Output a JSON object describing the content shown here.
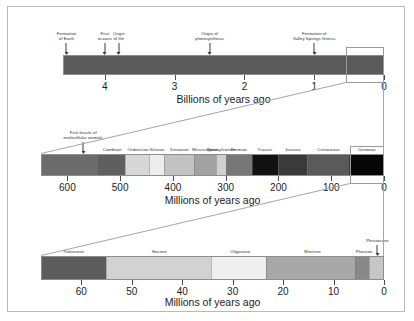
{
  "figure": {
    "background": "#ffffff",
    "border_color": "#b9b9b9"
  },
  "bands": [
    {
      "id": "precambrian-to-present",
      "axis_caption": "Billions of years ago",
      "axis_unit": "billions",
      "axis_min": 0,
      "axis_max": 4.6,
      "ticks": [
        {
          "value": 4,
          "label": "4"
        },
        {
          "value": 3,
          "label": "3"
        },
        {
          "value": 2,
          "label": "2"
        },
        {
          "value": 1,
          "label": "1"
        },
        {
          "value": 0,
          "label": "0"
        }
      ],
      "bar_color": "#5b5b5b",
      "events": [
        {
          "label_line1": "Formation",
          "label_line2": "of Earth",
          "value": 4.55
        },
        {
          "label_line1": "First",
          "label_line2": "oceans",
          "value": 4.0
        },
        {
          "label_line1": "Origin",
          "label_line2": "of life",
          "value": 3.8
        },
        {
          "label_line1": "Origin of",
          "label_line2": "photosynthesis",
          "value": 2.5
        },
        {
          "label_line1": "Formation of",
          "label_line2": "Valley Springs  Gneiss",
          "value": 1.0
        }
      ],
      "zoom_box": {
        "from_value": 0.55,
        "to_value": 0.0
      }
    },
    {
      "id": "phanerozoic",
      "axis_caption": "Millions of years ago",
      "axis_unit": "millions",
      "axis_min": 0,
      "axis_max": 650,
      "ticks": [
        {
          "value": 600,
          "label": "600"
        },
        {
          "value": 500,
          "label": "500"
        },
        {
          "value": 400,
          "label": "400"
        },
        {
          "value": 300,
          "label": "300"
        },
        {
          "value": 200,
          "label": "200"
        },
        {
          "value": 100,
          "label": "100"
        },
        {
          "value": 0,
          "label": "0"
        }
      ],
      "periods": [
        {
          "name": "",
          "from": 650,
          "to": 542,
          "color": "#6c6c6c",
          "show_label": false
        },
        {
          "name": "Cambrian",
          "from": 542,
          "to": 488,
          "color": "#5f5f5f",
          "show_label": true
        },
        {
          "name": "Ordovician",
          "from": 488,
          "to": 444,
          "color": "#d7d7d7",
          "show_label": true
        },
        {
          "name": "Silurian",
          "from": 444,
          "to": 416,
          "color": "#ededed",
          "show_label": true
        },
        {
          "name": "Devonian",
          "from": 416,
          "to": 359,
          "color": "#c2c2c2",
          "show_label": true
        },
        {
          "name": "Mississippian",
          "from": 359,
          "to": 318,
          "color": "#a2a2a2",
          "show_label": true
        },
        {
          "name": "Pennsylvanian",
          "from": 318,
          "to": 299,
          "color": "#cfcfcf",
          "show_label": true
        },
        {
          "name": "Permian",
          "from": 299,
          "to": 251,
          "color": "#777777",
          "show_label": true
        },
        {
          "name": "Triassic",
          "from": 251,
          "to": 200,
          "color": "#111111",
          "show_label": true
        },
        {
          "name": "Jurassic",
          "from": 200,
          "to": 145,
          "color": "#3a3a3a",
          "show_label": true
        },
        {
          "name": "Cretaceous",
          "from": 145,
          "to": 65,
          "color": "#5a5a5a",
          "show_label": true
        },
        {
          "name": "Cenozoic",
          "from": 65,
          "to": 0,
          "color": "#070707",
          "show_label": true
        }
      ],
      "events": [
        {
          "label_line1": "First fossils of",
          "label_line2": "multicellular animals",
          "value": 570
        }
      ],
      "zoom_box": {
        "from_value": 65,
        "to_value": 0
      }
    },
    {
      "id": "cenozoic",
      "axis_caption": "Millions of years ago",
      "axis_unit": "millions",
      "axis_min": 0,
      "axis_max": 68,
      "ticks": [
        {
          "value": 60,
          "label": "60"
        },
        {
          "value": 50,
          "label": "50"
        },
        {
          "value": 40,
          "label": "40"
        },
        {
          "value": 30,
          "label": "30"
        },
        {
          "value": 20,
          "label": "20"
        },
        {
          "value": 10,
          "label": "10"
        },
        {
          "value": 0,
          "label": "0"
        }
      ],
      "periods": [
        {
          "name": "Paleocene",
          "from": 68,
          "to": 55,
          "color": "#5d5d5d",
          "show_label": true
        },
        {
          "name": "Eocene",
          "from": 55,
          "to": 34,
          "color": "#d2d2d2",
          "show_label": true
        },
        {
          "name": "Oligocene",
          "from": 34,
          "to": 23,
          "color": "#efefef",
          "show_label": true
        },
        {
          "name": "Miocene",
          "from": 23,
          "to": 5.3,
          "color": "#a8a8a8",
          "show_label": true
        },
        {
          "name": "Pliocene",
          "from": 5.3,
          "to": 2.6,
          "color": "#888888",
          "show_label": true
        },
        {
          "name": "",
          "from": 2.6,
          "to": 0,
          "color": "#c6c6c6",
          "show_label": false
        }
      ],
      "events": [
        {
          "label_line1": "Pleistocene",
          "label_line2": "",
          "value": 1.3
        }
      ]
    }
  ]
}
